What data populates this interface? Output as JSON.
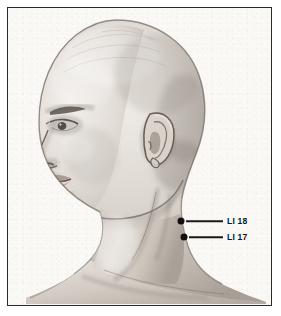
{
  "figure": {
    "medium": "graphite pencil illustration",
    "frame_color": "#2a2a2a",
    "paper_color": "#faf9f6",
    "marker_color": "#111111",
    "label_color": "#141414"
  },
  "annotations": {
    "points": [
      {
        "id": "li-18",
        "label": "LI 18",
        "dot_x": 173,
        "dot_y": 213,
        "line_start_x": 178,
        "line_end_x": 215,
        "label_x": 219,
        "label_y": 213
      },
      {
        "id": "li-17",
        "label": "LI 17",
        "dot_x": 176,
        "dot_y": 229,
        "line_start_x": 181,
        "line_end_x": 215,
        "label_x": 219,
        "label_y": 229
      }
    ]
  }
}
